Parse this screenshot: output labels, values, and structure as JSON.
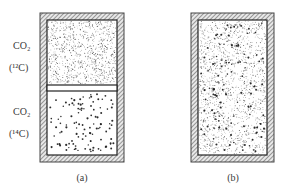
{
  "figure": {
    "panel_a": {
      "caption": "(a)",
      "upper_chamber": {
        "gas": "CO₂",
        "isotope_label": "(¹²C)",
        "density": "dense-fine"
      },
      "lower_chamber": {
        "gas": "CO₂",
        "isotope_label": "(¹⁴C)",
        "density": "sparse-coarse"
      },
      "divider": "partition"
    },
    "panel_b": {
      "caption": "(b)",
      "chamber": {
        "content": "mixed",
        "density": "dense-mixed"
      }
    }
  },
  "colors": {
    "wall": "#555555",
    "hatch": "#9a9a9a",
    "particle": "#222222",
    "background": "#ffffff"
  }
}
